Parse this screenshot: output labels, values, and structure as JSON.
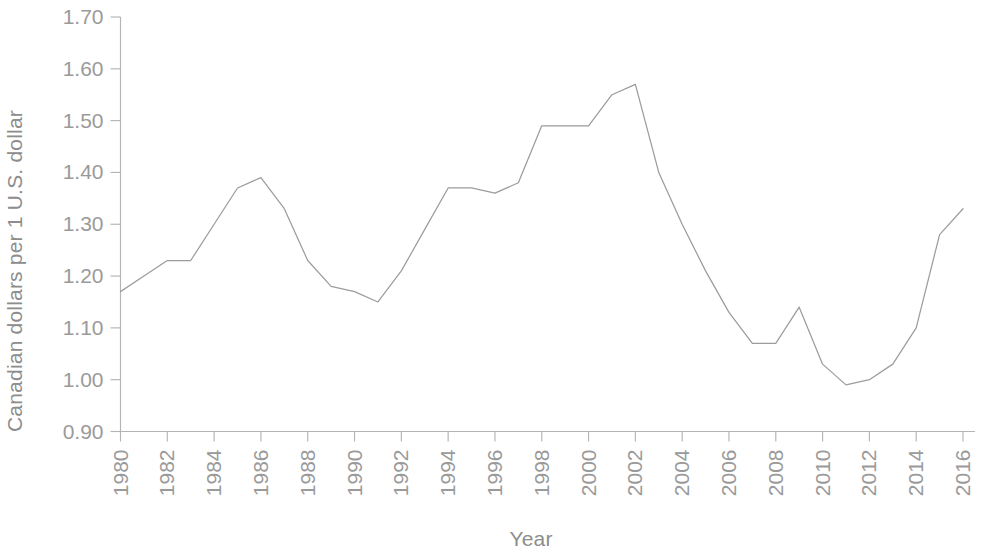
{
  "chart_data": {
    "type": "line",
    "title": "",
    "xlabel": "Year",
    "ylabel": "Canadian dollars per 1 U.S. dollar",
    "xlim": [
      1980,
      2016
    ],
    "ylim": [
      0.9,
      1.7
    ],
    "grid": false,
    "legend": null,
    "line_color": "#9c9c9c",
    "axis_color": "#b4b4b4",
    "text_color": "#9a9a9a",
    "y_ticks": [
      "0.90",
      "1.00",
      "1.10",
      "1.20",
      "1.30",
      "1.40",
      "1.50",
      "1.60",
      "1.70"
    ],
    "y_tick_values": [
      0.9,
      1.0,
      1.1,
      1.2,
      1.3,
      1.4,
      1.5,
      1.6,
      1.7
    ],
    "x_ticks": [
      "1980",
      "1982",
      "1984",
      "1986",
      "1988",
      "1990",
      "1992",
      "1994",
      "1996",
      "1998",
      "2000",
      "2002",
      "2004",
      "2006",
      "2008",
      "2010",
      "2012",
      "2014",
      "2016"
    ],
    "x_tick_values": [
      1980,
      1982,
      1984,
      1986,
      1988,
      1990,
      1992,
      1994,
      1996,
      1998,
      2000,
      2002,
      2004,
      2006,
      2008,
      2010,
      2012,
      2014,
      2016
    ],
    "x": [
      1980,
      1981,
      1982,
      1983,
      1984,
      1985,
      1986,
      1987,
      1988,
      1989,
      1990,
      1991,
      1992,
      1993,
      1994,
      1995,
      1996,
      1997,
      1998,
      1999,
      2000,
      2001,
      2002,
      2003,
      2004,
      2005,
      2006,
      2007,
      2008,
      2009,
      2010,
      2011,
      2012,
      2013,
      2014,
      2015,
      2016
    ],
    "series": [
      {
        "name": "Canadian dollars per 1 U.S. dollar",
        "values": [
          1.17,
          1.2,
          1.23,
          1.23,
          1.3,
          1.37,
          1.39,
          1.33,
          1.23,
          1.18,
          1.17,
          1.15,
          1.21,
          1.29,
          1.37,
          1.37,
          1.36,
          1.38,
          1.49,
          1.49,
          1.49,
          1.55,
          1.57,
          1.4,
          1.3,
          1.21,
          1.13,
          1.07,
          1.07,
          1.14,
          1.03,
          0.99,
          1.0,
          1.03,
          1.1,
          1.28,
          1.33
        ]
      }
    ]
  }
}
